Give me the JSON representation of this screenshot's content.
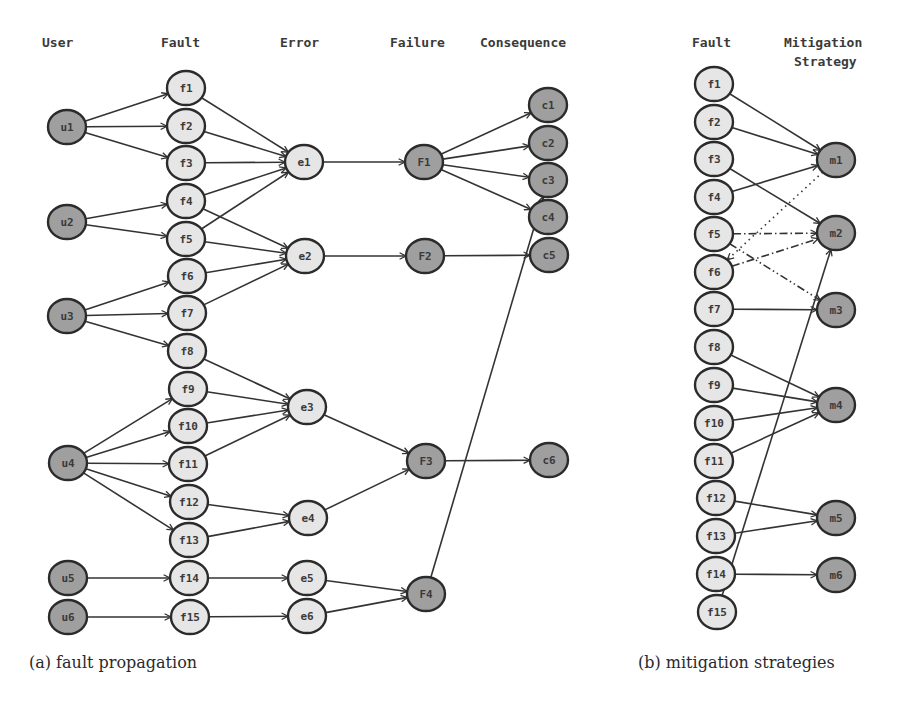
{
  "colors": {
    "light_node": "#e6e6e6",
    "dark_node": "#9f9f9f",
    "stroke": "#2b2b2b",
    "edge": "#333333"
  },
  "panel_a": {
    "caption": "(a) fault propagation",
    "caption_pos": [
      29,
      668
    ],
    "headers": [
      {
        "text": "User",
        "x": 42,
        "y": 47
      },
      {
        "text": "Fault",
        "x": 161,
        "y": 47
      },
      {
        "text": "Error",
        "x": 280,
        "y": 47
      },
      {
        "text": "Failure",
        "x": 390,
        "y": 47
      },
      {
        "text": "Consequence",
        "x": 480,
        "y": 47
      }
    ],
    "nodes": [
      {
        "id": "u1",
        "label": "u1",
        "x": 67,
        "y": 127,
        "kind": "dark"
      },
      {
        "id": "u2",
        "label": "u2",
        "x": 67,
        "y": 222,
        "kind": "dark"
      },
      {
        "id": "u3",
        "label": "u3",
        "x": 67,
        "y": 316,
        "kind": "dark"
      },
      {
        "id": "u4",
        "label": "u4",
        "x": 68,
        "y": 463,
        "kind": "dark"
      },
      {
        "id": "u5",
        "label": "u5",
        "x": 68,
        "y": 578,
        "kind": "dark"
      },
      {
        "id": "u6",
        "label": "u6",
        "x": 68,
        "y": 617,
        "kind": "dark"
      },
      {
        "id": "af1",
        "label": "f1",
        "x": 186,
        "y": 88,
        "kind": "light"
      },
      {
        "id": "af2",
        "label": "f2",
        "x": 186,
        "y": 126,
        "kind": "light"
      },
      {
        "id": "af3",
        "label": "f3",
        "x": 186,
        "y": 163,
        "kind": "light"
      },
      {
        "id": "af4",
        "label": "f4",
        "x": 186,
        "y": 201,
        "kind": "light"
      },
      {
        "id": "af5",
        "label": "f5",
        "x": 186,
        "y": 239,
        "kind": "light"
      },
      {
        "id": "af6",
        "label": "f6",
        "x": 187,
        "y": 276,
        "kind": "light"
      },
      {
        "id": "af7",
        "label": "f7",
        "x": 187,
        "y": 313,
        "kind": "light"
      },
      {
        "id": "af8",
        "label": "f8",
        "x": 187,
        "y": 351,
        "kind": "light"
      },
      {
        "id": "af9",
        "label": "f9",
        "x": 188,
        "y": 389,
        "kind": "light"
      },
      {
        "id": "af10",
        "label": "f10",
        "x": 188,
        "y": 426,
        "kind": "light"
      },
      {
        "id": "af11",
        "label": "f11",
        "x": 188,
        "y": 464,
        "kind": "light"
      },
      {
        "id": "af12",
        "label": "f12",
        "x": 189,
        "y": 502,
        "kind": "light"
      },
      {
        "id": "af13",
        "label": "f13",
        "x": 189,
        "y": 540,
        "kind": "light"
      },
      {
        "id": "af14",
        "label": "f14",
        "x": 189,
        "y": 578,
        "kind": "light"
      },
      {
        "id": "af15",
        "label": "f15",
        "x": 190,
        "y": 617,
        "kind": "light"
      },
      {
        "id": "e1",
        "label": "e1",
        "x": 304,
        "y": 162,
        "kind": "light"
      },
      {
        "id": "e2",
        "label": "e2",
        "x": 305,
        "y": 256,
        "kind": "light"
      },
      {
        "id": "e3",
        "label": "e3",
        "x": 307,
        "y": 407,
        "kind": "light"
      },
      {
        "id": "e4",
        "label": "e4",
        "x": 308,
        "y": 518,
        "kind": "light"
      },
      {
        "id": "e5",
        "label": "e5",
        "x": 307,
        "y": 578,
        "kind": "light"
      },
      {
        "id": "e6",
        "label": "e6",
        "x": 307,
        "y": 616,
        "kind": "light"
      },
      {
        "id": "F1",
        "label": "F1",
        "x": 424,
        "y": 162,
        "kind": "dark"
      },
      {
        "id": "F2",
        "label": "F2",
        "x": 425,
        "y": 256,
        "kind": "dark"
      },
      {
        "id": "F3",
        "label": "F3",
        "x": 426,
        "y": 461,
        "kind": "dark"
      },
      {
        "id": "F4",
        "label": "F4",
        "x": 426,
        "y": 594,
        "kind": "dark"
      },
      {
        "id": "c1",
        "label": "c1",
        "x": 548,
        "y": 105,
        "kind": "dark"
      },
      {
        "id": "c2",
        "label": "c2",
        "x": 548,
        "y": 143,
        "kind": "dark"
      },
      {
        "id": "c3",
        "label": "c3",
        "x": 548,
        "y": 180,
        "kind": "dark"
      },
      {
        "id": "c4",
        "label": "c4",
        "x": 548,
        "y": 217,
        "kind": "dark"
      },
      {
        "id": "c5",
        "label": "c5",
        "x": 549,
        "y": 255,
        "kind": "dark"
      },
      {
        "id": "c6",
        "label": "c6",
        "x": 549,
        "y": 460,
        "kind": "dark"
      }
    ],
    "edges": [
      [
        "u1",
        "af1"
      ],
      [
        "u1",
        "af2"
      ],
      [
        "u1",
        "af3"
      ],
      [
        "u2",
        "af4"
      ],
      [
        "u2",
        "af5"
      ],
      [
        "u3",
        "af6"
      ],
      [
        "u3",
        "af7"
      ],
      [
        "u3",
        "af8"
      ],
      [
        "u4",
        "af9"
      ],
      [
        "u4",
        "af10"
      ],
      [
        "u4",
        "af11"
      ],
      [
        "u4",
        "af12"
      ],
      [
        "u4",
        "af13"
      ],
      [
        "u5",
        "af14"
      ],
      [
        "u6",
        "af15"
      ],
      [
        "af1",
        "e1"
      ],
      [
        "af2",
        "e1"
      ],
      [
        "af3",
        "e1"
      ],
      [
        "af4",
        "e1"
      ],
      [
        "af5",
        "e1"
      ],
      [
        "af4",
        "e2"
      ],
      [
        "af5",
        "e2"
      ],
      [
        "af6",
        "e2"
      ],
      [
        "af7",
        "e2"
      ],
      [
        "af8",
        "e3"
      ],
      [
        "af9",
        "e3"
      ],
      [
        "af10",
        "e3"
      ],
      [
        "af11",
        "e3"
      ],
      [
        "af12",
        "e4"
      ],
      [
        "af13",
        "e4"
      ],
      [
        "af14",
        "e5"
      ],
      [
        "af15",
        "e6"
      ],
      [
        "e1",
        "F1"
      ],
      [
        "e2",
        "F2"
      ],
      [
        "e3",
        "F3"
      ],
      [
        "e4",
        "F3"
      ],
      [
        "e5",
        "F4"
      ],
      [
        "e6",
        "F4"
      ],
      [
        "F1",
        "c1"
      ],
      [
        "F1",
        "c2"
      ],
      [
        "F1",
        "c3"
      ],
      [
        "F1",
        "c4"
      ],
      [
        "F2",
        "c5"
      ],
      [
        "F3",
        "c6"
      ],
      [
        "F4",
        "c3"
      ]
    ]
  },
  "panel_b": {
    "caption": "(b) mitigation strategies",
    "caption_pos": [
      638,
      668
    ],
    "headers": [
      {
        "text": "Fault",
        "x": 692,
        "y": 47
      },
      {
        "text": "Mitigation",
        "x": 784,
        "y": 47
      },
      {
        "text": "Strategy",
        "x": 794,
        "y": 66
      }
    ],
    "nodes": [
      {
        "id": "bf1",
        "label": "f1",
        "x": 714,
        "y": 84,
        "kind": "light"
      },
      {
        "id": "bf2",
        "label": "f2",
        "x": 714,
        "y": 122,
        "kind": "light"
      },
      {
        "id": "bf3",
        "label": "f3",
        "x": 714,
        "y": 159,
        "kind": "light"
      },
      {
        "id": "bf4",
        "label": "f4",
        "x": 714,
        "y": 197,
        "kind": "light"
      },
      {
        "id": "bf5",
        "label": "f5",
        "x": 714,
        "y": 234,
        "kind": "light"
      },
      {
        "id": "bf6",
        "label": "f6",
        "x": 714,
        "y": 272,
        "kind": "light"
      },
      {
        "id": "bf7",
        "label": "f7",
        "x": 714,
        "y": 309,
        "kind": "light"
      },
      {
        "id": "bf8",
        "label": "f8",
        "x": 714,
        "y": 347,
        "kind": "light"
      },
      {
        "id": "bf9",
        "label": "f9",
        "x": 714,
        "y": 385,
        "kind": "light"
      },
      {
        "id": "bf10",
        "label": "f10",
        "x": 714,
        "y": 423,
        "kind": "light"
      },
      {
        "id": "bf11",
        "label": "f11",
        "x": 714,
        "y": 461,
        "kind": "light"
      },
      {
        "id": "bf12",
        "label": "f12",
        "x": 716,
        "y": 498,
        "kind": "light"
      },
      {
        "id": "bf13",
        "label": "f13",
        "x": 716,
        "y": 536,
        "kind": "light"
      },
      {
        "id": "bf14",
        "label": "f14",
        "x": 716,
        "y": 574,
        "kind": "light"
      },
      {
        "id": "bf15",
        "label": "f15",
        "x": 717,
        "y": 612,
        "kind": "light"
      },
      {
        "id": "m1",
        "label": "m1",
        "x": 836,
        "y": 160,
        "kind": "dark"
      },
      {
        "id": "m2",
        "label": "m2",
        "x": 836,
        "y": 233,
        "kind": "dark"
      },
      {
        "id": "m3",
        "label": "m3",
        "x": 836,
        "y": 310,
        "kind": "dark"
      },
      {
        "id": "m4",
        "label": "m4",
        "x": 836,
        "y": 405,
        "kind": "dark"
      },
      {
        "id": "m5",
        "label": "m5",
        "x": 836,
        "y": 518,
        "kind": "dark"
      },
      {
        "id": "m6",
        "label": "m6",
        "x": 836,
        "y": 575,
        "kind": "dark"
      }
    ],
    "edges": [
      {
        "from": "bf1",
        "to": "m1",
        "style": "solid"
      },
      {
        "from": "bf2",
        "to": "m1",
        "style": "solid"
      },
      {
        "from": "bf4",
        "to": "m1",
        "style": "solid"
      },
      {
        "from": "m1",
        "to": "bf6",
        "style": "dotted"
      },
      {
        "from": "bf3",
        "to": "m2",
        "style": "solid"
      },
      {
        "from": "bf5",
        "to": "m2",
        "style": "dashdot"
      },
      {
        "from": "bf6",
        "to": "m2",
        "style": "dashdot"
      },
      {
        "from": "bf15",
        "to": "m2",
        "style": "solid"
      },
      {
        "from": "bf5",
        "to": "m3",
        "style": "dashdotdot"
      },
      {
        "from": "bf7",
        "to": "m3",
        "style": "solid"
      },
      {
        "from": "bf8",
        "to": "m4",
        "style": "solid"
      },
      {
        "from": "bf9",
        "to": "m4",
        "style": "solid"
      },
      {
        "from": "bf10",
        "to": "m4",
        "style": "solid"
      },
      {
        "from": "bf11",
        "to": "m4",
        "style": "solid"
      },
      {
        "from": "bf12",
        "to": "m5",
        "style": "solid"
      },
      {
        "from": "bf13",
        "to": "m5",
        "style": "solid"
      },
      {
        "from": "bf14",
        "to": "m6",
        "style": "solid"
      }
    ]
  }
}
